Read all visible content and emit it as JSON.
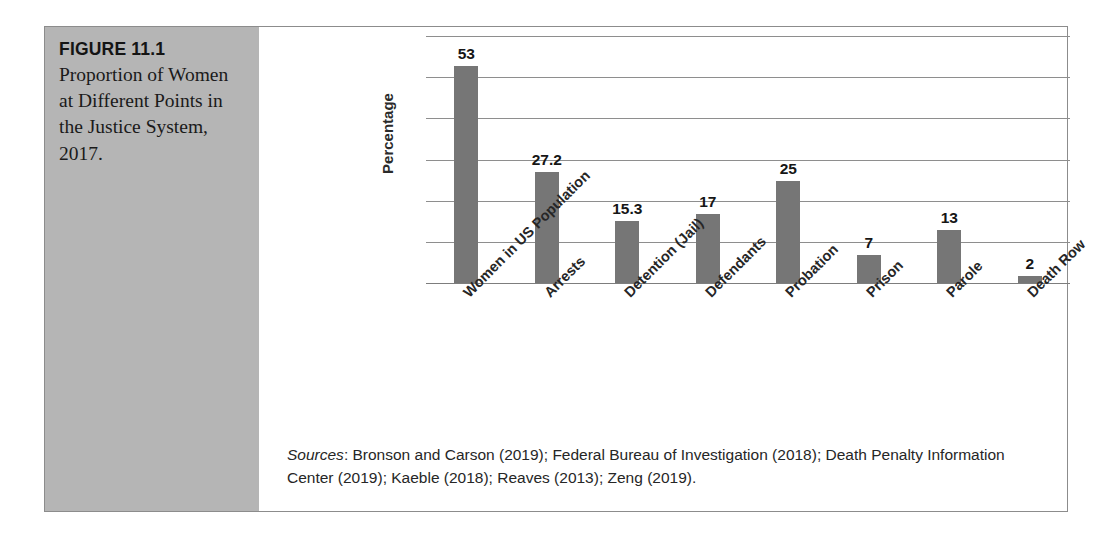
{
  "figure": {
    "number": "FIGURE 11.1",
    "caption": "Proportion of Women at Different Points in the Justice System, 2017."
  },
  "sources": {
    "label": "Sources",
    "text": ": Bronson and Carson (2019); Federal Bureau of Investigation (2018); Death Penalty Information Center (2019); Kaeble (2018); Reaves (2013); Zeng (2019)."
  },
  "colors": {
    "bar": "#767676",
    "panel": "#b5b5b5",
    "gridline": "#8e8e8e",
    "border": "#8c8c8c"
  },
  "chart_data": {
    "type": "bar",
    "title": "Proportion of Women at Different Points in the Justice System, 2017.",
    "xlabel": "",
    "ylabel": "Percentage",
    "ylim": [
      0,
      60
    ],
    "ytick_step": 10,
    "yticks": [
      0,
      10,
      20,
      30,
      40,
      50,
      60
    ],
    "ytick_labels_visible": false,
    "grid": true,
    "legend": false,
    "categories": [
      "Women in US Population",
      "Arrests",
      "Detention (Jail)",
      "Defendants",
      "Probation",
      "Prison",
      "Parole",
      "Death Row"
    ],
    "values": [
      53,
      27.2,
      15.3,
      17,
      25,
      7,
      13,
      2
    ],
    "value_labels": [
      "53",
      "27.2",
      "15.3",
      "17",
      "25",
      "7",
      "13",
      "2"
    ]
  }
}
